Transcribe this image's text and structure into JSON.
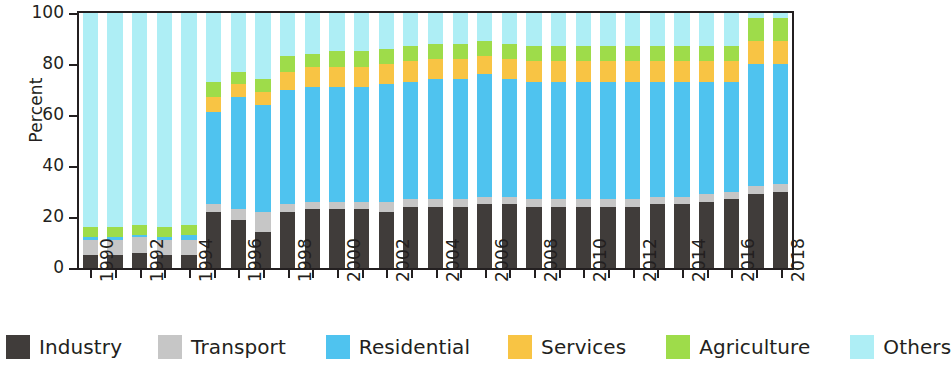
{
  "chart_data": {
    "type": "bar",
    "subtype": "stacked-bar-100-percent",
    "title": "",
    "xlabel": "",
    "ylabel": "Percent",
    "ylim": [
      0,
      100
    ],
    "yticks": [
      0,
      20,
      40,
      60,
      80,
      100
    ],
    "grid": false,
    "legend_position": "bottom",
    "categories": [
      "1990",
      "1991",
      "1992",
      "1993",
      "1994",
      "1995",
      "1996",
      "1997",
      "1998",
      "1999",
      "2000",
      "2001",
      "2002",
      "2003",
      "2004",
      "2005",
      "2006",
      "2007",
      "2008",
      "2009",
      "2010",
      "2011",
      "2012",
      "2013",
      "2014",
      "2015",
      "2016",
      "2017",
      "2018"
    ],
    "tick_labels": [
      "1990",
      "",
      "1992",
      "",
      "1994",
      "",
      "1996",
      "",
      "1998",
      "",
      "2000",
      "",
      "2002",
      "",
      "2004",
      "",
      "2006",
      "",
      "2008",
      "",
      "2010",
      "",
      "2012",
      "",
      "2014",
      "",
      "2016",
      "",
      "2018"
    ],
    "series": [
      {
        "name": "Industry",
        "color": "#403C3A",
        "values": [
          5,
          5,
          6,
          5,
          5,
          22,
          19,
          14,
          22,
          23,
          23,
          23,
          22,
          24,
          24,
          24,
          25,
          25,
          24,
          24,
          24,
          24,
          24,
          25,
          25,
          26,
          27,
          29,
          30
        ]
      },
      {
        "name": "Transport",
        "color": "#C6C6C6",
        "values": [
          6,
          6,
          6,
          6,
          6,
          3,
          4,
          8,
          3,
          3,
          3,
          3,
          4,
          3,
          3,
          3,
          3,
          3,
          3,
          3,
          3,
          3,
          3,
          3,
          3,
          3,
          3,
          3,
          3
        ]
      },
      {
        "name": "Residential",
        "color": "#4FC3EF",
        "values": [
          1,
          1,
          1,
          1,
          2,
          36,
          44,
          42,
          45,
          45,
          45,
          45,
          46,
          46,
          47,
          47,
          48,
          46,
          46,
          46,
          46,
          46,
          46,
          45,
          45,
          44,
          43,
          48,
          47
        ]
      },
      {
        "name": "Services",
        "color": "#F8C444",
        "values": [
          0,
          0,
          0,
          0,
          0,
          6,
          5,
          5,
          7,
          8,
          8,
          8,
          8,
          8,
          8,
          8,
          7,
          8,
          8,
          8,
          8,
          8,
          8,
          8,
          8,
          8,
          8,
          9,
          9
        ]
      },
      {
        "name": "Agriculture",
        "color": "#9EDC4A",
        "values": [
          4,
          4,
          4,
          4,
          4,
          6,
          5,
          5,
          6,
          5,
          6,
          6,
          6,
          6,
          6,
          6,
          6,
          6,
          6,
          6,
          6,
          6,
          6,
          6,
          6,
          6,
          6,
          9,
          9
        ]
      },
      {
        "name": "Others",
        "color": "#AEEEF5",
        "values": [
          84,
          84,
          83,
          84,
          83,
          27,
          23,
          26,
          17,
          16,
          15,
          15,
          14,
          13,
          12,
          12,
          11,
          12,
          13,
          13,
          13,
          13,
          13,
          13,
          13,
          13,
          13,
          2,
          2
        ]
      }
    ]
  },
  "axis": {
    "y_title": "Percent",
    "y_tick_labels": [
      "0",
      "20",
      "40",
      "60",
      "80",
      "100"
    ]
  },
  "legend": {
    "items": [
      {
        "label": "Industry",
        "color": "#403C3A"
      },
      {
        "label": "Transport",
        "color": "#C6C6C6"
      },
      {
        "label": "Residential",
        "color": "#4FC3EF"
      },
      {
        "label": "Services",
        "color": "#F8C444"
      },
      {
        "label": "Agriculture",
        "color": "#9EDC4A"
      },
      {
        "label": "Others",
        "color": "#AEEEF5"
      }
    ]
  }
}
